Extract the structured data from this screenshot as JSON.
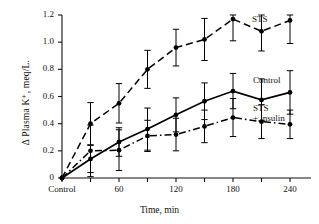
{
  "chart_data": {
    "type": "line",
    "title": "",
    "xlabel": "Time, min",
    "ylabel": "Δ Plasma K⁺, meq/L.",
    "xlim": [
      0,
      270
    ],
    "ylim": [
      0,
      1.2
    ],
    "grid": false,
    "legend_position": "right-of-curves",
    "x": [
      0,
      30,
      60,
      90,
      120,
      150,
      180,
      210,
      240
    ],
    "xticks": [
      0,
      30,
      60,
      90,
      120,
      150,
      180,
      210,
      240
    ],
    "xticklabels": [
      "Control",
      "",
      "60",
      "",
      "120",
      "",
      "180",
      "",
      "240"
    ],
    "yticks": [
      0,
      0.2,
      0.4,
      0.6,
      0.8,
      1.0,
      1.2
    ],
    "yticklabels": [
      "0",
      "0.2",
      "0.4",
      "0.6",
      "0.8",
      "1.0",
      "1.2"
    ],
    "series": [
      {
        "name": "STS",
        "label": "STS",
        "linestyle": "dashed",
        "marker": "filled-circle",
        "color": "#000000",
        "values": [
          0.0,
          0.4,
          0.55,
          0.8,
          0.96,
          1.02,
          1.17,
          1.08,
          1.16
        ],
        "errors": [
          0.0,
          0.155,
          0.145,
          0.14,
          0.135,
          0.155,
          0.16,
          0.145,
          0.17
        ]
      },
      {
        "name": "Control",
        "label": "Control",
        "linestyle": "solid",
        "marker": "filled-circle",
        "color": "#000000",
        "values": [
          0.0,
          0.14,
          0.265,
          0.36,
          0.465,
          0.565,
          0.64,
          0.575,
          0.63
        ],
        "errors": [
          0.0,
          0.1,
          0.105,
          0.155,
          0.125,
          0.135,
          0.13,
          0.155,
          0.16
        ]
      },
      {
        "name": "STS + insulin",
        "label": "STS\n+ insulin",
        "linestyle": "dash-dot",
        "marker": "filled-circle",
        "color": "#000000",
        "values": [
          0.0,
          0.2,
          0.205,
          0.31,
          0.32,
          0.38,
          0.445,
          0.415,
          0.395
        ],
        "errors": [
          0.0,
          0.19,
          0.15,
          0.115,
          0.12,
          0.12,
          0.14,
          0.125,
          0.105
        ]
      }
    ],
    "annotations": [
      {
        "text": "STS",
        "x": 252,
        "y": 20
      },
      {
        "text": "Control",
        "x": 253,
        "y": 81
      },
      {
        "text": "STS\n+ insulin",
        "x": 253,
        "y": 110
      }
    ]
  }
}
